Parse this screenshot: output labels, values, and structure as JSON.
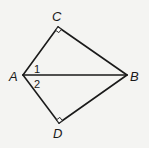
{
  "diagram": {
    "type": "geometry-figure",
    "vertices": {
      "A": {
        "label": "A",
        "x": 23,
        "y": 75,
        "label_x": 9,
        "label_y": 81
      },
      "B": {
        "label": "B",
        "x": 127,
        "y": 75,
        "label_x": 130,
        "label_y": 81
      },
      "C": {
        "label": "C",
        "x": 58,
        "y": 27,
        "label_x": 52,
        "label_y": 21
      },
      "D": {
        "label": "D",
        "x": 59,
        "y": 123,
        "label_x": 53,
        "label_y": 138
      }
    },
    "segments": [
      {
        "from": "A",
        "to": "C"
      },
      {
        "from": "C",
        "to": "B"
      },
      {
        "from": "A",
        "to": "B"
      },
      {
        "from": "A",
        "to": "D"
      },
      {
        "from": "D",
        "to": "B"
      }
    ],
    "right_angles": [
      {
        "at": "C",
        "label": "right-angle-C"
      },
      {
        "at": "D",
        "label": "right-angle-D"
      }
    ],
    "angle_labels": [
      {
        "text": "1",
        "x": 34,
        "y": 73,
        "between": [
          "AC",
          "AB"
        ]
      },
      {
        "text": "2",
        "x": 34,
        "y": 88,
        "between": [
          "AB",
          "AD"
        ]
      }
    ],
    "colors": {
      "stroke": "#1a1a1a",
      "background": "#f4f4f2"
    }
  }
}
